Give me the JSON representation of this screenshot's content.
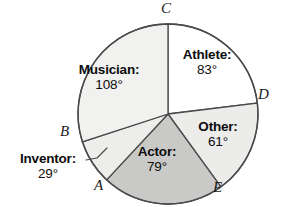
{
  "chart_data": {
    "type": "pie",
    "title": "",
    "subtitle": "",
    "xlabel": "",
    "ylabel": "",
    "legend_position": "none",
    "grid": false,
    "units": "degrees",
    "total_degrees": 360,
    "categories": [
      "Athlete",
      "Other",
      "Actor",
      "Inventor",
      "Musician"
    ],
    "values": [
      83,
      61,
      79,
      29,
      108
    ],
    "slices": [
      {
        "name": "Athlete",
        "label": "Athlete:",
        "value": 83,
        "value_text": "83°",
        "start_deg": 0,
        "end_deg": 83,
        "fill": "#ffffff",
        "label_placement": "inside"
      },
      {
        "name": "Other",
        "label": "Other:",
        "value": 61,
        "value_text": "61°",
        "start_deg": 83,
        "end_deg": 144,
        "fill": "#ececeb",
        "label_placement": "inside"
      },
      {
        "name": "Actor",
        "label": "Actor:",
        "value": 79,
        "value_text": "79°",
        "start_deg": 144,
        "end_deg": 223,
        "fill": "#c9c9c7",
        "label_placement": "inside"
      },
      {
        "name": "Inventor",
        "label": "Inventor:",
        "value": 29,
        "value_text": "29°",
        "start_deg": 223,
        "end_deg": 252,
        "fill": "#ededeb",
        "label_placement": "outside-leader"
      },
      {
        "name": "Musician",
        "label": "Musician:",
        "value": 108,
        "value_text": "108°",
        "start_deg": 252,
        "end_deg": 360,
        "fill": "#f1f1ef",
        "label_placement": "inside"
      }
    ],
    "boundary_points": [
      {
        "name": "A",
        "at_deg": 223
      },
      {
        "name": "B",
        "at_deg": 252
      },
      {
        "name": "C",
        "at_deg": 0
      },
      {
        "name": "D",
        "at_deg": 83
      },
      {
        "name": "E",
        "at_deg": 144
      }
    ],
    "colors": {
      "stroke": "#4a4a4a",
      "text": "#0d0d0d",
      "background": "#ffffff"
    }
  }
}
